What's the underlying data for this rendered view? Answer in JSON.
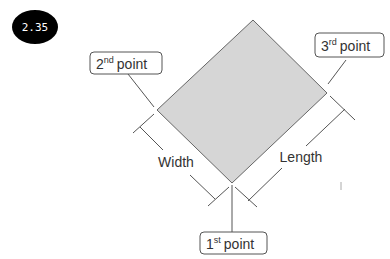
{
  "badge": {
    "label": "2.35",
    "color": "#000000"
  },
  "shape": {
    "type": "rotated-rectangle",
    "fill": "#d6d6d6",
    "stroke": "#666666"
  },
  "labels": {
    "first_point": {
      "num": "1",
      "sup": "st",
      "text": "point"
    },
    "second_point": {
      "num": "2",
      "sup": "nd",
      "text": "point"
    },
    "third_point": {
      "num": "3",
      "sup": "rd",
      "text": "point"
    }
  },
  "dimensions": {
    "width": "Width",
    "length": "Length"
  }
}
